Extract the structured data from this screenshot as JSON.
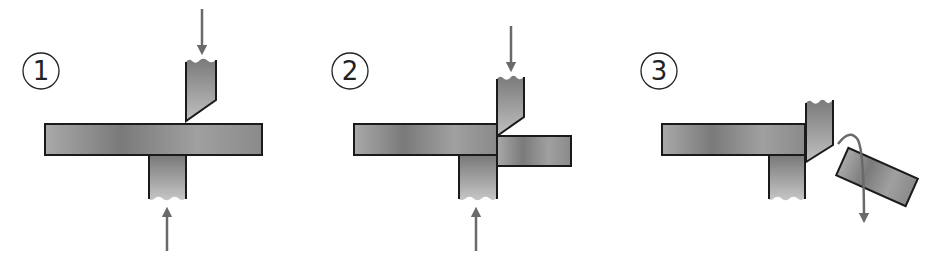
{
  "diagram": {
    "colors": {
      "background": "#ffffff",
      "outline": "#1a1a1a",
      "metal_light": "#b4b4b4",
      "metal_dark": "#6e6e6e",
      "arrow": "#6a6a6a"
    },
    "steps": [
      {
        "label": "1",
        "description": "Upper blade descends toward workpiece resting on lower die",
        "arrows": [
          "upper-blade-force-down",
          "lower-die-force-up"
        ]
      },
      {
        "label": "2",
        "description": "Upper blade shears workpiece, offset piece pushed down",
        "arrows": [
          "upper-blade-force-down",
          "lower-die-force-up"
        ]
      },
      {
        "label": "3",
        "description": "Sheared piece separates and falls away",
        "arrows": [
          "sheared-piece-fall"
        ]
      }
    ]
  }
}
